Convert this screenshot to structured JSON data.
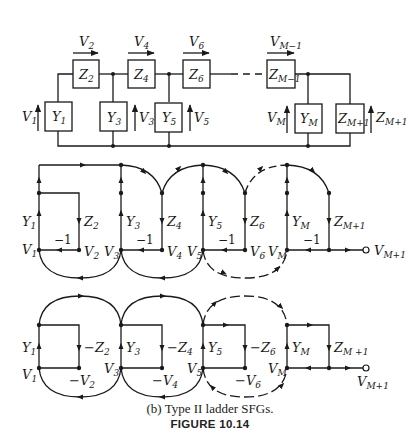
{
  "circuit": {
    "series_impedances": [
      {
        "name": "Z",
        "sub": "2"
      },
      {
        "name": "Z",
        "sub": "4"
      },
      {
        "name": "Z",
        "sub": "6"
      },
      {
        "name": "Z",
        "sub": "M−1"
      }
    ],
    "shunt_admittances": [
      {
        "name": "Y",
        "sub": "1"
      },
      {
        "name": "Y",
        "sub": "3"
      },
      {
        "name": "Y",
        "sub": "5"
      },
      {
        "name": "Y",
        "sub": "M"
      }
    ],
    "load": {
      "name": "Z",
      "sub": "M+1"
    },
    "series_voltages": [
      {
        "name": "V",
        "sub": "2"
      },
      {
        "name": "V",
        "sub": "4"
      },
      {
        "name": "V",
        "sub": "6"
      },
      {
        "name": "V",
        "sub": "M−1"
      }
    ],
    "shunt_voltages": [
      {
        "name": "V",
        "sub": "1"
      },
      {
        "name": "V",
        "sub": "3"
      },
      {
        "name": "V",
        "sub": "5"
      },
      {
        "name": "V",
        "sub": "M"
      }
    ],
    "load_voltage": {
      "name": "Z",
      "sub": "M+1"
    }
  },
  "sfg_upper": {
    "nodes": [
      {
        "name": "V",
        "sub": "1"
      },
      {
        "name": "V",
        "sub": "2"
      },
      {
        "name": "V",
        "sub": "3"
      },
      {
        "name": "V",
        "sub": "4"
      },
      {
        "name": "V",
        "sub": "5"
      },
      {
        "name": "V",
        "sub": "6"
      },
      {
        "name": "V",
        "sub": "M"
      },
      {
        "name": "V",
        "sub": "M+1"
      }
    ],
    "branches": [
      {
        "name": "Y",
        "sub": "1"
      },
      {
        "name": "Z",
        "sub": "2"
      },
      {
        "name": "Y",
        "sub": "3"
      },
      {
        "name": "Z",
        "sub": "4"
      },
      {
        "name": "Y",
        "sub": "5"
      },
      {
        "name": "Z",
        "sub": "6"
      },
      {
        "name": "Y",
        "sub": "M"
      },
      {
        "name": "Z",
        "sub": "M+1"
      }
    ],
    "unity_gain": "−1"
  },
  "sfg_lower": {
    "nodes": [
      {
        "name": "V",
        "sub": "1"
      },
      {
        "name": "−V",
        "sub": "2"
      },
      {
        "name": "V",
        "sub": "3"
      },
      {
        "name": "−V",
        "sub": "4"
      },
      {
        "name": "V",
        "sub": "5"
      },
      {
        "name": "−V",
        "sub": "6"
      },
      {
        "name": "V",
        "sub": "M"
      },
      {
        "name": "V",
        "sub": "M+1"
      }
    ],
    "branches": [
      {
        "name": "Y",
        "sub": "1"
      },
      {
        "name": "−Z",
        "sub": "2"
      },
      {
        "name": "Y",
        "sub": "3"
      },
      {
        "name": "−Z",
        "sub": "4"
      },
      {
        "name": "Y",
        "sub": "5"
      },
      {
        "name": "−Z",
        "sub": "6"
      },
      {
        "name": "Y",
        "sub": "M"
      },
      {
        "name": "Z",
        "sub": "M +1"
      }
    ]
  },
  "caption": {
    "subtitle": "(b)  Type II ladder SFGs.",
    "title": "FIGURE 10.14"
  }
}
